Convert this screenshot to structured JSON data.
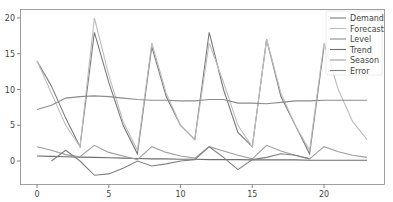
{
  "chart_data": {
    "type": "line",
    "title": "",
    "xlabel": "",
    "ylabel": "",
    "xlim": [
      -1.2,
      24.1
    ],
    "ylim": [
      -3.2,
      21.2
    ],
    "grid": false,
    "legend_position": "upper right",
    "x_ticks": [
      0,
      5,
      10,
      15,
      20
    ],
    "y_ticks": [
      0,
      5,
      10,
      15,
      20
    ],
    "series": [
      {
        "name": "Demand",
        "color": "#7a7a7a",
        "x": [
          0,
          1,
          2,
          3,
          4,
          5,
          6,
          7,
          8,
          9,
          10,
          11,
          12,
          13,
          14,
          15,
          16,
          17,
          18,
          19,
          20
        ],
        "values": [
          14,
          10.5,
          6,
          2,
          18,
          11,
          5,
          1,
          16,
          9,
          5,
          3,
          18,
          10,
          4,
          2,
          17,
          9,
          5,
          1,
          16
        ]
      },
      {
        "name": "Forecast",
        "color": "#bdbdbd",
        "x": [
          0,
          1,
          2,
          3,
          4,
          5,
          6,
          7,
          8,
          9,
          10,
          11,
          12,
          13,
          14,
          15,
          16,
          17,
          18,
          19,
          20,
          21,
          22,
          23
        ],
        "values": [
          14,
          9.5,
          5,
          2,
          20,
          12,
          5.5,
          1.5,
          16.5,
          9.5,
          5,
          3,
          16.5,
          11,
          5,
          2,
          17,
          9.5,
          5,
          1.5,
          16.5,
          10,
          5.5,
          3
        ]
      },
      {
        "name": "Level",
        "color": "#8c8c8c",
        "x": [
          0,
          1,
          2,
          3,
          4,
          5,
          6,
          7,
          8,
          9,
          10,
          11,
          12,
          13,
          14,
          15,
          16,
          17,
          18,
          19,
          20,
          21,
          22,
          23
        ],
        "values": [
          7.2,
          7.8,
          8.8,
          9,
          9.1,
          9,
          8.8,
          8.6,
          8.5,
          8.5,
          8.4,
          8.4,
          8.6,
          8.6,
          8.1,
          8.1,
          8.0,
          8.2,
          8.4,
          8.4,
          8.5,
          8.5,
          8.5,
          8.5
        ]
      },
      {
        "name": "Trend",
        "color": "#6e6e6e",
        "x": [
          0,
          1,
          2,
          3,
          4,
          5,
          6,
          7,
          8,
          9,
          10,
          11,
          12,
          13,
          14,
          15,
          16,
          17,
          18,
          19,
          20,
          21,
          22,
          23
        ],
        "values": [
          0.7,
          0.65,
          0.6,
          0.55,
          0.5,
          0.45,
          0.4,
          0.35,
          0.3,
          0.3,
          0.25,
          0.25,
          0.2,
          0.2,
          0.2,
          0.15,
          0.15,
          0.15,
          0.15,
          0.1,
          0.1,
          0.1,
          0.1,
          0.1
        ]
      },
      {
        "name": "Season",
        "color": "#9e9e9e",
        "x": [
          0,
          1,
          2,
          3,
          4,
          5,
          6,
          7,
          8,
          9,
          10,
          11,
          12,
          13,
          14,
          15,
          16,
          17,
          18,
          19,
          20,
          21,
          22,
          23
        ],
        "values": [
          2,
          1.5,
          0.9,
          0.6,
          2.2,
          1.2,
          0.7,
          0.2,
          2,
          1.2,
          0.7,
          0.4,
          2,
          1.4,
          0.8,
          0.3,
          2.2,
          1.4,
          0.8,
          0.3,
          2,
          1.3,
          0.8,
          0.5
        ]
      },
      {
        "name": "Error",
        "color": "#808080",
        "x": [
          1,
          2,
          3,
          4,
          5,
          6,
          7,
          8,
          9,
          10,
          11,
          12,
          13,
          14,
          15,
          16,
          17,
          18,
          19
        ],
        "values": [
          0,
          1.5,
          0,
          -2,
          -1.8,
          -1,
          0,
          -0.7,
          -0.4,
          0,
          0.2,
          2,
          0.5,
          -1.2,
          0.2,
          0.5,
          1,
          0.8,
          0.3
        ]
      }
    ]
  }
}
